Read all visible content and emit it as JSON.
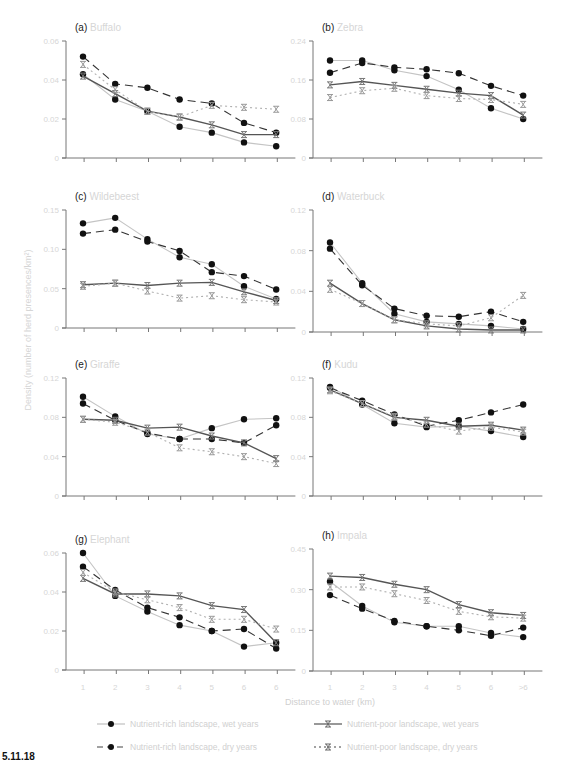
{
  "figure": {
    "caption": "5.11.18",
    "xlabel": "Distance to water (km)",
    "ylabel": "Density (number of herd presences/km²)",
    "x_tick_labels_left": [
      "1",
      "2",
      "3",
      "4",
      "5",
      "6",
      "6"
    ],
    "x_tick_labels_right": [
      "1",
      "2",
      "3",
      "4",
      "5",
      "6",
      ">6"
    ],
    "legend": [
      {
        "label": "Nutrient-rich landscape, wet years",
        "marker": "circle",
        "line": "solid",
        "color": "#bdbdbd"
      },
      {
        "label": "Nutrient-poor landscape, wet years",
        "marker": "star",
        "line": "solid",
        "color": "#555555"
      },
      {
        "label": "Nutrient-rich landscape, dry years",
        "marker": "circle",
        "line": "dashed",
        "color": "#333333"
      },
      {
        "label": "Nutrient-poor landscape, dry years",
        "marker": "star",
        "line": "dotted",
        "color": "#aaaaaa"
      }
    ]
  },
  "chart_data": [
    {
      "type": "line",
      "panel": "(a)",
      "title": "Buffalo",
      "xlabel": "Distance to water (km)",
      "ylabel": "Density (number of herd presences/km²)",
      "categories": [
        "1",
        "2",
        "3",
        "4",
        "5",
        "6",
        "6"
      ],
      "yticks": [
        "0",
        "0.02",
        "0.04",
        "0.06"
      ],
      "ylim": [
        0,
        0.06
      ],
      "series": [
        {
          "name": "Nutrient-rich landscape, wet years",
          "values": [
            0.043,
            0.03,
            0.024,
            0.016,
            0.013,
            0.008,
            0.006
          ]
        },
        {
          "name": "Nutrient-rich landscape, dry years",
          "values": [
            0.052,
            0.038,
            0.036,
            0.03,
            0.028,
            0.018,
            0.013
          ]
        },
        {
          "name": "Nutrient-poor landscape, wet years",
          "values": [
            0.042,
            0.033,
            0.024,
            0.021,
            0.017,
            0.012,
            0.012
          ]
        },
        {
          "name": "Nutrient-poor landscape, dry years",
          "values": [
            0.048,
            0.035,
            0.024,
            0.021,
            0.027,
            0.026,
            0.025
          ]
        }
      ]
    },
    {
      "type": "line",
      "panel": "(b)",
      "title": "Zebra",
      "categories": [
        "1",
        "2",
        "3",
        "4",
        "5",
        "6",
        ">6"
      ],
      "yticks": [
        "0",
        "0.08",
        "0.16",
        "0.24"
      ],
      "ylim": [
        0,
        0.24
      ],
      "series": [
        {
          "name": "Nutrient-rich landscape, wet years",
          "values": [
            0.2,
            0.2,
            0.18,
            0.168,
            0.14,
            0.102,
            0.08
          ]
        },
        {
          "name": "Nutrient-rich landscape, dry years",
          "values": [
            0.175,
            0.195,
            0.186,
            0.182,
            0.174,
            0.148,
            0.128
          ]
        },
        {
          "name": "Nutrient-poor landscape, wet years",
          "values": [
            0.15,
            0.157,
            0.149,
            0.141,
            0.133,
            0.128,
            0.088
          ]
        },
        {
          "name": "Nutrient-poor landscape, dry years",
          "values": [
            0.124,
            0.138,
            0.143,
            0.128,
            0.122,
            0.12,
            0.11
          ]
        }
      ]
    },
    {
      "type": "line",
      "panel": "(c)",
      "title": "Wildebeest",
      "categories": [
        "1",
        "2",
        "3",
        "4",
        "5",
        "6",
        "6"
      ],
      "yticks": [
        "0",
        "0.05",
        "0.10",
        "0.15"
      ],
      "ylim": [
        0,
        0.15
      ],
      "series": [
        {
          "name": "Nutrient-rich landscape, wet years",
          "values": [
            0.133,
            0.14,
            0.113,
            0.09,
            0.081,
            0.053,
            0.037
          ]
        },
        {
          "name": "Nutrient-rich landscape, dry years",
          "values": [
            0.12,
            0.125,
            0.11,
            0.098,
            0.071,
            0.066,
            0.049
          ]
        },
        {
          "name": "Nutrient-poor landscape, wet years",
          "values": [
            0.055,
            0.057,
            0.054,
            0.057,
            0.058,
            0.046,
            0.035
          ]
        },
        {
          "name": "Nutrient-poor landscape, dry years",
          "values": [
            0.053,
            0.057,
            0.047,
            0.038,
            0.041,
            0.036,
            0.033
          ]
        }
      ]
    },
    {
      "type": "line",
      "panel": "(d)",
      "title": "Waterbuck",
      "categories": [
        "1",
        "2",
        "3",
        "4",
        "5",
        "6",
        ">6"
      ],
      "yticks": [
        "0",
        "0.04",
        "0.08",
        "0.12"
      ],
      "ylim": [
        0,
        0.12
      ],
      "series": [
        {
          "name": "Nutrient-rich landscape, wet years",
          "values": [
            0.088,
            0.048,
            0.018,
            0.01,
            0.008,
            0.006,
            0.003
          ]
        },
        {
          "name": "Nutrient-rich landscape, dry years",
          "values": [
            0.082,
            0.046,
            0.023,
            0.016,
            0.015,
            0.02,
            0.01
          ]
        },
        {
          "name": "Nutrient-poor landscape, wet years",
          "values": [
            0.048,
            0.028,
            0.012,
            0.006,
            0.003,
            0.002,
            0.002
          ]
        },
        {
          "name": "Nutrient-poor landscape, dry years",
          "values": [
            0.042,
            0.028,
            0.012,
            0.008,
            0.006,
            0.014,
            0.036
          ]
        }
      ]
    },
    {
      "type": "line",
      "panel": "(e)",
      "title": "Giraffe",
      "categories": [
        "1",
        "2",
        "3",
        "4",
        "5",
        "6",
        "6"
      ],
      "yticks": [
        "0",
        "0.04",
        "0.08",
        "0.12"
      ],
      "ylim": [
        0,
        0.12
      ],
      "series": [
        {
          "name": "Nutrient-rich landscape, wet years",
          "values": [
            0.101,
            0.081,
            0.063,
            0.058,
            0.069,
            0.078,
            0.079
          ]
        },
        {
          "name": "Nutrient-rich landscape, dry years",
          "values": [
            0.094,
            0.077,
            0.064,
            0.058,
            0.058,
            0.054,
            0.072
          ]
        },
        {
          "name": "Nutrient-poor landscape, wet years",
          "values": [
            0.078,
            0.077,
            0.069,
            0.07,
            0.061,
            0.054,
            0.038
          ]
        },
        {
          "name": "Nutrient-poor landscape, dry years",
          "values": [
            0.078,
            0.075,
            0.065,
            0.049,
            0.045,
            0.04,
            0.033
          ]
        }
      ]
    },
    {
      "type": "line",
      "panel": "(f)",
      "title": "Kudu",
      "categories": [
        "1",
        "2",
        "3",
        "4",
        "5",
        "6",
        ">6"
      ],
      "yticks": [
        "0",
        "0.04",
        "0.08",
        "0.12"
      ],
      "ylim": [
        0,
        0.12
      ],
      "series": [
        {
          "name": "Nutrient-rich landscape, wet years",
          "values": [
            0.111,
            0.093,
            0.074,
            0.07,
            0.071,
            0.066,
            0.06
          ]
        },
        {
          "name": "Nutrient-rich landscape, dry years",
          "values": [
            0.11,
            0.097,
            0.083,
            0.071,
            0.077,
            0.085,
            0.093
          ]
        },
        {
          "name": "Nutrient-poor landscape, wet years",
          "values": [
            0.108,
            0.094,
            0.08,
            0.077,
            0.071,
            0.072,
            0.067
          ]
        },
        {
          "name": "Nutrient-poor landscape, dry years",
          "values": [
            0.107,
            0.094,
            0.081,
            0.073,
            0.066,
            0.07,
            0.065
          ]
        }
      ]
    },
    {
      "type": "line",
      "panel": "(g)",
      "title": "Elephant",
      "categories": [
        "1",
        "2",
        "3",
        "4",
        "5",
        "6",
        "6"
      ],
      "yticks": [
        "0",
        "0.02",
        "0.04",
        "0.06"
      ],
      "ylim": [
        0,
        0.06
      ],
      "series": [
        {
          "name": "Nutrient-rich landscape, wet years",
          "values": [
            0.06,
            0.038,
            0.03,
            0.023,
            0.02,
            0.012,
            0.014
          ]
        },
        {
          "name": "Nutrient-rich landscape, dry years",
          "values": [
            0.053,
            0.041,
            0.032,
            0.027,
            0.02,
            0.021,
            0.011
          ]
        },
        {
          "name": "Nutrient-poor landscape, wet years",
          "values": [
            0.047,
            0.039,
            0.039,
            0.038,
            0.033,
            0.031,
            0.014
          ]
        },
        {
          "name": "Nutrient-poor landscape, dry years",
          "values": [
            0.05,
            0.04,
            0.036,
            0.032,
            0.026,
            0.026,
            0.021
          ]
        }
      ]
    },
    {
      "type": "line",
      "panel": "(h)",
      "title": "Impala",
      "categories": [
        "1",
        "2",
        "3",
        "4",
        "5",
        "6",
        ">6"
      ],
      "yticks": [
        "0",
        "0.15",
        "0.30",
        "0.45"
      ],
      "ylim": [
        0,
        0.45
      ],
      "series": [
        {
          "name": "Nutrient-rich landscape, wet years",
          "values": [
            0.33,
            0.24,
            0.18,
            0.165,
            0.165,
            0.14,
            0.125
          ]
        },
        {
          "name": "Nutrient-rich landscape, dry years",
          "values": [
            0.28,
            0.23,
            0.185,
            0.165,
            0.15,
            0.13,
            0.16
          ]
        },
        {
          "name": "Nutrient-poor landscape, wet years",
          "values": [
            0.35,
            0.345,
            0.32,
            0.3,
            0.245,
            0.215,
            0.205
          ]
        },
        {
          "name": "Nutrient-poor landscape, dry years",
          "values": [
            0.31,
            0.31,
            0.285,
            0.26,
            0.22,
            0.2,
            0.195
          ]
        }
      ]
    }
  ]
}
